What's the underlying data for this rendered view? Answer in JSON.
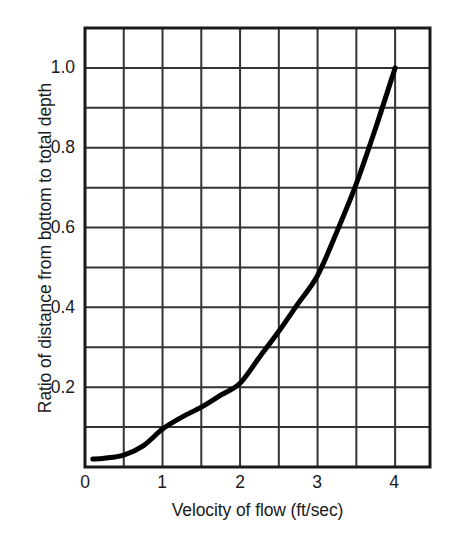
{
  "chart_data": {
    "type": "line",
    "title": "",
    "subtitle": "",
    "xlabel": "Velocity of flow (ft/sec)",
    "ylabel": "Ratio of distance from bottom to total depth",
    "xlim": [
      0,
      4.45
    ],
    "ylim": [
      0,
      1.1
    ],
    "xticks": [
      0,
      1,
      2,
      3,
      4
    ],
    "xtick_labels": [
      "0",
      "1",
      "2",
      "3",
      "4"
    ],
    "yticks": [
      0.2,
      0.4,
      0.6,
      0.8,
      1.0
    ],
    "ytick_labels": [
      "0.2",
      "0.4",
      "0.6",
      "0.8",
      "1.0"
    ],
    "grid": true,
    "grid_x_step": 0.5,
    "grid_y_step": 0.1,
    "legend": null,
    "legend_position": "none",
    "series": [
      {
        "name": "Velocity profile",
        "color": "#000000",
        "line_width": 5,
        "x": [
          0.1,
          0.25,
          0.5,
          0.75,
          1.0,
          1.25,
          1.5,
          1.75,
          2.0,
          2.25,
          2.5,
          2.75,
          3.0,
          3.25,
          3.5,
          3.75,
          4.0
        ],
        "y": [
          0.02,
          0.022,
          0.03,
          0.053,
          0.095,
          0.125,
          0.15,
          0.18,
          0.21,
          0.275,
          0.34,
          0.41,
          0.48,
          0.59,
          0.71,
          0.85,
          1.0
        ]
      }
    ],
    "annotations": []
  },
  "axes": {
    "x_axis_name": "Velocity of flow (ft/sec)",
    "y_axis_name": "Ratio of distance from bottom to total depth"
  },
  "colors": {
    "curve": "#0d0d0d",
    "frame": "#1a1a1a",
    "grid": "#333333",
    "background": "#ffffff",
    "text": "#1a1a1a"
  }
}
